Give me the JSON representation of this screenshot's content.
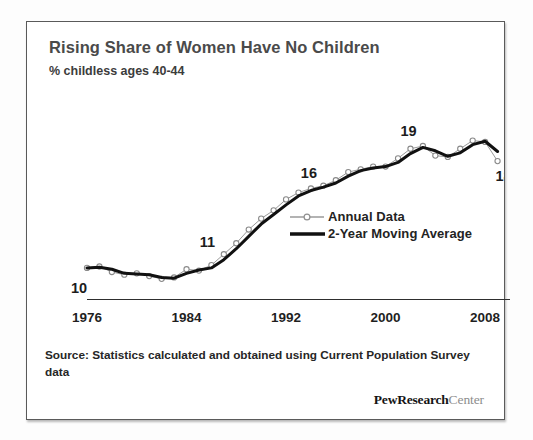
{
  "card": {
    "title": "Rising Share of Women Have No Children",
    "subtitle": "% childless  ages 40-44",
    "source_note": "Source: Statistics calculated and obtained using Current Population Survey data",
    "logo_bold": "PewResearch",
    "logo_light": "Center",
    "border_color": "#5a5a5a",
    "background": "#ffffff"
  },
  "legend": {
    "position": "inside-right",
    "items": [
      {
        "label": "Annual Data",
        "style": "thin-line-open-circle",
        "color": "#9a9a9a"
      },
      {
        "label": "2-Year Moving Average",
        "style": "thick-line",
        "color": "#111111"
      }
    ]
  },
  "chart_data": {
    "type": "line",
    "title": "Rising Share of Women Have No Children",
    "subtitle": "% childless  ages 40-44",
    "xlabel": "",
    "ylabel": "% childless ages 40-44",
    "xlim": [
      1976,
      2010
    ],
    "ylim": [
      8,
      21
    ],
    "grid": false,
    "xticks": [
      1976,
      1984,
      1992,
      2000,
      2008
    ],
    "xtick_labels": [
      "1976",
      "1984",
      "1992",
      "2000",
      "2008"
    ],
    "yticks": [],
    "annotations": [
      {
        "text": "10",
        "x": 1976,
        "y": 10
      },
      {
        "text": "11",
        "x": 1986,
        "y": 11
      },
      {
        "text": "16",
        "x": 1994,
        "y": 16
      },
      {
        "text": "19",
        "x": 2002,
        "y": 19
      },
      {
        "text": "18",
        "x": 2009,
        "y": 18
      }
    ],
    "x": [
      1976,
      1977,
      1978,
      1979,
      1980,
      1981,
      1982,
      1983,
      1984,
      1985,
      1986,
      1987,
      1988,
      1989,
      1990,
      1991,
      1992,
      1993,
      1994,
      1995,
      1996,
      1997,
      1998,
      1999,
      2000,
      2001,
      2002,
      2003,
      2004,
      2005,
      2006,
      2007,
      2008,
      2009
    ],
    "series": [
      {
        "name": "Annual Data",
        "color": "#9a9a9a",
        "marker": "open-circle",
        "linewidth": 1,
        "values": [
          10.2,
          10.3,
          9.9,
          9.7,
          9.8,
          9.6,
          9.4,
          9.5,
          10.1,
          10.0,
          10.4,
          11.2,
          12.0,
          13.0,
          13.8,
          14.4,
          15.2,
          15.7,
          16.0,
          16.2,
          16.6,
          17.2,
          17.4,
          17.6,
          17.6,
          18.2,
          18.9,
          19.1,
          18.4,
          18.3,
          18.9,
          19.5,
          19.4,
          18.0
        ]
      },
      {
        "name": "2-Year Moving Average",
        "color": "#111111",
        "marker": "none",
        "linewidth": 3,
        "values": [
          10.2,
          10.25,
          10.1,
          9.8,
          9.75,
          9.7,
          9.5,
          9.45,
          9.8,
          10.05,
          10.2,
          10.8,
          11.6,
          12.5,
          13.4,
          14.1,
          14.8,
          15.45,
          15.85,
          16.1,
          16.4,
          16.9,
          17.3,
          17.5,
          17.6,
          17.9,
          18.55,
          19.0,
          18.75,
          18.35,
          18.6,
          19.2,
          19.45,
          18.7
        ]
      }
    ]
  }
}
